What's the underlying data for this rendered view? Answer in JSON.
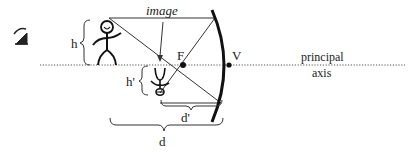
{
  "diagram": {
    "labels": {
      "image": "image",
      "focal_point": "F",
      "vertex": "V",
      "axis_line1": "principal",
      "axis_line2": "axis",
      "object_height": "h",
      "image_height": "h'",
      "image_distance": "d'",
      "object_distance": "d"
    },
    "icons": {
      "corner_glyph": "eye-icon"
    },
    "colors": {
      "ink": "#222222",
      "background": "#ffffff"
    }
  }
}
